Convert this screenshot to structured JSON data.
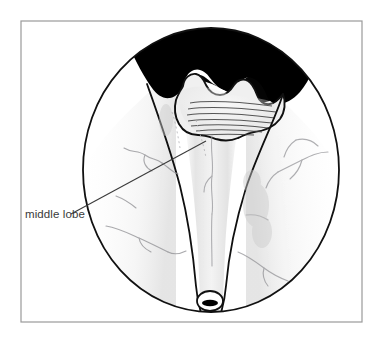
{
  "figure": {
    "kind": "medical-illustration",
    "view": "cystoscopic",
    "title": "",
    "background_color": "#ffffff"
  },
  "frame": {
    "name": "image-border",
    "x": 21,
    "y": 21,
    "width": 341,
    "height": 301,
    "stroke_color": "#9a9a9a",
    "stroke_width": 1.2
  },
  "scope_view": {
    "name": "cystoscope-circle",
    "center_x": 211,
    "center_y": 170,
    "radius_x": 128,
    "radius_y": 142,
    "stroke_color": "#111111",
    "stroke_width": 1.8,
    "fill_color": "#ffffff"
  },
  "median_lobe_mass": {
    "name": "median-lobe-black-mass",
    "fill_color": "#000000",
    "description": "occluding prostatic median lobe silhouette at top of view"
  },
  "median_lobe_outline": {
    "name": "median-lobe-scalloped-outline",
    "stroke_color": "#111111",
    "striation_color": "#3c3c3c",
    "striation_count": 7
  },
  "lateral_lobes": {
    "name": "lateral-lobe-walls",
    "stroke_color": "#111111",
    "stroke_width": 1.7,
    "shading_color": "#d9d9d9"
  },
  "verumontanum": {
    "name": "verumontanum",
    "center_x": 210,
    "center_y": 301,
    "radius_x": 13,
    "radius_y": 10,
    "stroke_color": "#111111",
    "bar_color": "#000000"
  },
  "vasculature": {
    "name": "mucosal-vessels",
    "stroke_color": "#8e8e92",
    "opacity": 0.75
  },
  "annotation": {
    "name": "middle-lobe-annotation",
    "label": "middle lobe",
    "label_x": 25,
    "label_y": 218,
    "text_color": "#3a3a3a",
    "leader_line": {
      "name": "leader-line",
      "x1": 71,
      "y1": 214,
      "x2": 206,
      "y2": 141,
      "stroke_color": "#3a3a3a",
      "stroke_width": 1.1
    }
  }
}
